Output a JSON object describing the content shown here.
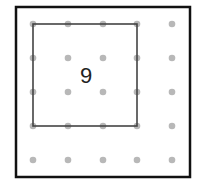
{
  "diagram": {
    "type": "geoboard",
    "grid": {
      "rows": 5,
      "cols": 5,
      "dot_color": "#b8b8b8"
    },
    "square": {
      "from": [
        0,
        0
      ],
      "to": [
        3,
        3
      ],
      "stroke": "#444444"
    },
    "area_label": "9",
    "frame_color": "#111111"
  }
}
